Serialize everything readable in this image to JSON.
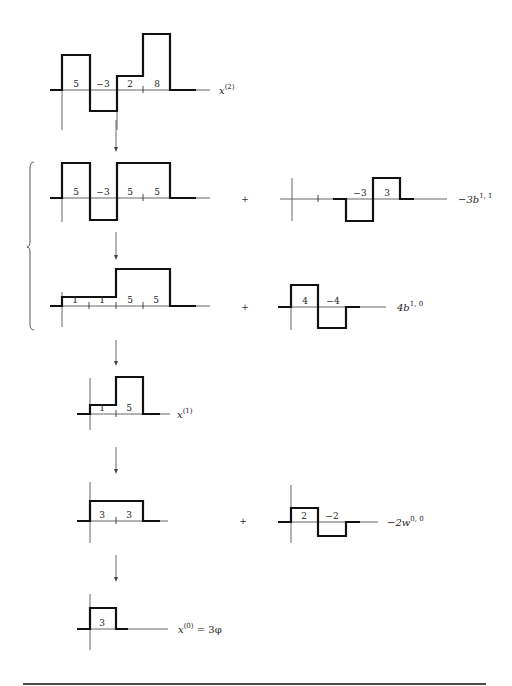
{
  "colors": {
    "signal": "#111111",
    "axis": "#555555",
    "text": "#222222"
  },
  "rows": [
    {
      "id": "x2",
      "axis_y": 90,
      "vline_x": 62,
      "vline_top": 90,
      "vline_bottom": 130,
      "axis_start": 50,
      "axis_end": 210,
      "signal_points": "50,90 62,90 62,55 90,55 90,111 117,111 117,76 143,76 143,34 170,34 170,90 196,90",
      "ticks": [
        143
      ],
      "values": [
        {
          "x": 76,
          "text": "5"
        },
        {
          "x": 103,
          "text": "−3"
        },
        {
          "x": 130,
          "text": "2"
        },
        {
          "x": 157,
          "text": "8"
        }
      ],
      "label": {
        "x": 219,
        "base": "x",
        "sup": "(2)"
      },
      "extra_vline": {
        "x": 117,
        "top": 111,
        "bottom": 130
      }
    },
    {
      "id": "row2-left",
      "axis_y": 198,
      "vline_x": 62,
      "vline_top": 198,
      "vline_bottom": 222,
      "axis_start": 50,
      "axis_end": 210,
      "signal_points": "50,198 62,198 62,163 90,163 90,220 117,220 117,163 170,163 170,198 196,198",
      "ticks": [
        143
      ],
      "values": [
        {
          "x": 76,
          "text": "5"
        },
        {
          "x": 103,
          "text": "−3"
        },
        {
          "x": 130,
          "text": "5"
        },
        {
          "x": 157,
          "text": "5"
        }
      ],
      "label": null
    },
    {
      "id": "row2-right",
      "axis_y": 199,
      "vline_x": 292,
      "vline_top": 178,
      "vline_bottom": 221,
      "axis_start": 280,
      "axis_end": 447,
      "signal_points": "333,199 346,199 346,221 373,221 373,178 400,178 400,199 414,199",
      "ticks": [
        318
      ],
      "values": [
        {
          "x": 360,
          "text": "−3"
        },
        {
          "x": 387,
          "text": "3"
        }
      ],
      "label": {
        "x": 458,
        "base": "−3b",
        "sup": "1, 1"
      }
    },
    {
      "id": "row3-left",
      "axis_y": 306,
      "vline_x": 62,
      "vline_top": 292,
      "vline_bottom": 327,
      "axis_start": 50,
      "axis_end": 210,
      "signal_points": "50,306 62,306 62,297 116,297 116,269 170,269 170,306 196,306",
      "ticks": [
        89,
        116,
        143
      ],
      "values": [
        {
          "x": 75,
          "text": "1"
        },
        {
          "x": 102,
          "text": "1"
        },
        {
          "x": 130,
          "text": "5"
        },
        {
          "x": 156,
          "text": "5"
        }
      ],
      "label": null
    },
    {
      "id": "row3-right",
      "axis_y": 307,
      "vline_x": 291,
      "vline_top": 307,
      "vline_bottom": 330,
      "axis_start": 278,
      "axis_end": 386,
      "signal_points": "278,307 291,307 291,285 318,285 318,328 346,328 346,307 360,307",
      "ticks": [],
      "values": [
        {
          "x": 305,
          "text": "4"
        },
        {
          "x": 333,
          "text": "−4"
        }
      ],
      "label": {
        "x": 397,
        "base": "4b",
        "sup": "1, 0"
      }
    },
    {
      "id": "x1",
      "axis_y": 414,
      "vline_x": 90,
      "vline_top": 378,
      "vline_bottom": 430,
      "axis_start": 77,
      "axis_end": 170,
      "signal_points": "77,414 90,414 90,405 116,405 116,377 143,377 143,414 160,414",
      "ticks": [
        116
      ],
      "values": [
        {
          "x": 102,
          "text": "1"
        },
        {
          "x": 129,
          "text": "5"
        }
      ],
      "label": {
        "x": 177,
        "base": "x",
        "sup": "(1)"
      }
    },
    {
      "id": "row5-left",
      "axis_y": 521,
      "vline_x": 90,
      "vline_top": 482,
      "vline_bottom": 543,
      "axis_start": 77,
      "axis_end": 168,
      "signal_points": "77,521 90,521 90,501 143,501 143,521 160,521",
      "ticks": [
        116
      ],
      "values": [
        {
          "x": 102,
          "text": "3"
        },
        {
          "x": 129,
          "text": "3"
        }
      ],
      "label": null
    },
    {
      "id": "row5-right",
      "axis_y": 522,
      "vline_x": 291,
      "vline_top": 485,
      "vline_bottom": 543,
      "axis_start": 278,
      "axis_end": 378,
      "signal_points": "278,522 291,522 291,508 318,508 318,536 346,536 346,522 360,522",
      "ticks": [],
      "values": [
        {
          "x": 304,
          "text": "2"
        },
        {
          "x": 332,
          "text": "−2"
        }
      ],
      "label": {
        "x": 387,
        "base": "−2w",
        "sup": "0, 0"
      }
    },
    {
      "id": "x0",
      "axis_y": 629,
      "vline_x": 90,
      "vline_top": 594,
      "vline_bottom": 650,
      "axis_start": 77,
      "axis_end": 168,
      "signal_points": "77,629 90,629 90,608 116,608 116,629 128,629",
      "ticks": [],
      "values": [
        {
          "x": 102,
          "text": "3"
        }
      ],
      "label": {
        "x": 178,
        "base": "x",
        "sup": "(0)",
        "suffix": " = 3φ"
      }
    }
  ],
  "arrows": [
    {
      "x": 116,
      "y1": 120,
      "y2": 152
    },
    {
      "x": 116,
      "y1": 232,
      "y2": 260
    },
    {
      "x": 116,
      "y1": 340,
      "y2": 366
    },
    {
      "x": 116,
      "y1": 447,
      "y2": 474
    },
    {
      "x": 116,
      "y1": 555,
      "y2": 582
    }
  ],
  "plus_signs": [
    {
      "x": 245,
      "y": 202,
      "text": "+"
    },
    {
      "x": 245,
      "y": 310,
      "text": "+"
    },
    {
      "x": 243,
      "y": 524,
      "text": "+"
    }
  ],
  "brace": {
    "x": 30,
    "top": 162,
    "mid": 247,
    "bottom": 330
  },
  "bottom_rule": {
    "x1": 23,
    "x2": 486,
    "y": 684
  }
}
